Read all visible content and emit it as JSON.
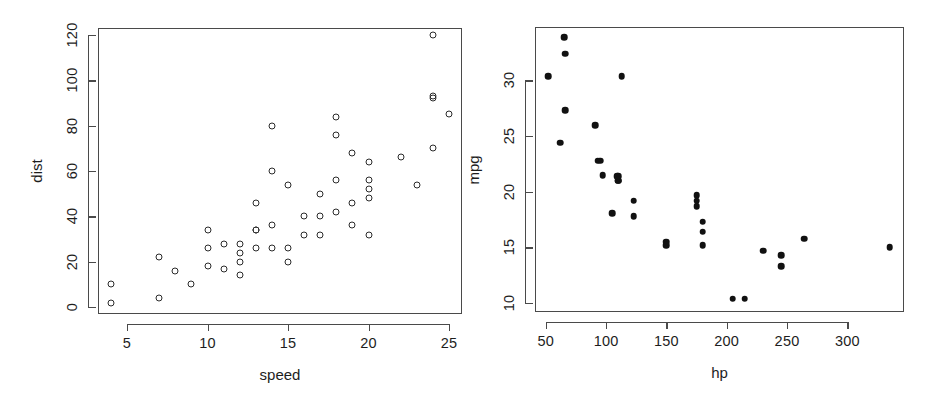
{
  "figure": {
    "width": 930,
    "height": 405,
    "background": "#ffffff",
    "panel_count": 2
  },
  "chart_data": [
    {
      "type": "scatter",
      "panel": "left",
      "title": "",
      "xlabel": "speed",
      "ylabel": "dist",
      "xlim": [
        3.2,
        25.8
      ],
      "ylim": [
        -3,
        123
      ],
      "xticks": [
        5,
        10,
        15,
        20,
        25
      ],
      "xticklabels": [
        "5",
        "10",
        "15",
        "20",
        "25"
      ],
      "yticks": [
        0,
        20,
        40,
        60,
        80,
        100,
        120
      ],
      "yticklabels": [
        "0",
        "20",
        "40",
        "60",
        "80",
        "100",
        "120"
      ],
      "grid": false,
      "legend": false,
      "marker": "open-circle",
      "marker_color": "#2b2b2b",
      "x": [
        4,
        4,
        7,
        7,
        8,
        9,
        10,
        10,
        10,
        11,
        11,
        12,
        12,
        12,
        12,
        13,
        13,
        13,
        13,
        14,
        14,
        14,
        14,
        15,
        15,
        15,
        16,
        16,
        17,
        17,
        17,
        18,
        18,
        18,
        18,
        19,
        19,
        19,
        20,
        20,
        20,
        20,
        20,
        22,
        23,
        24,
        24,
        24,
        24,
        25
      ],
      "y": [
        2,
        10,
        4,
        22,
        16,
        10,
        18,
        26,
        34,
        17,
        28,
        14,
        20,
        24,
        28,
        26,
        34,
        34,
        46,
        26,
        36,
        60,
        80,
        20,
        26,
        54,
        32,
        40,
        32,
        40,
        50,
        42,
        56,
        76,
        84,
        36,
        46,
        68,
        32,
        48,
        52,
        56,
        64,
        66,
        54,
        70,
        92,
        93,
        120,
        85
      ]
    },
    {
      "type": "scatter",
      "panel": "right",
      "title": "",
      "xlabel": "hp",
      "ylabel": "mpg",
      "xlim": [
        41,
        347
      ],
      "ylim": [
        9.2,
        34.8
      ],
      "xticks": [
        50,
        100,
        150,
        200,
        250,
        300
      ],
      "xticklabels": [
        "50",
        "100",
        "150",
        "200",
        "250",
        "300"
      ],
      "yticks": [
        10,
        15,
        20,
        25,
        30
      ],
      "yticklabels": [
        "10",
        "15",
        "20",
        "25",
        "30"
      ],
      "grid": false,
      "legend": false,
      "marker": "filled-circle",
      "marker_color": "#111111",
      "x": [
        110,
        110,
        93,
        110,
        175,
        105,
        245,
        62,
        95,
        123,
        123,
        180,
        180,
        180,
        205,
        215,
        230,
        66,
        52,
        65,
        97,
        150,
        150,
        245,
        175,
        66,
        91,
        113,
        264,
        175,
        335,
        109
      ],
      "y": [
        21.0,
        21.0,
        22.8,
        21.4,
        18.7,
        18.1,
        14.3,
        24.4,
        22.8,
        19.2,
        17.8,
        16.4,
        17.3,
        15.2,
        10.4,
        10.4,
        14.7,
        32.4,
        30.4,
        33.9,
        21.5,
        15.5,
        15.2,
        13.3,
        19.2,
        27.3,
        26.0,
        30.4,
        15.8,
        19.7,
        15.0,
        21.4
      ]
    }
  ]
}
